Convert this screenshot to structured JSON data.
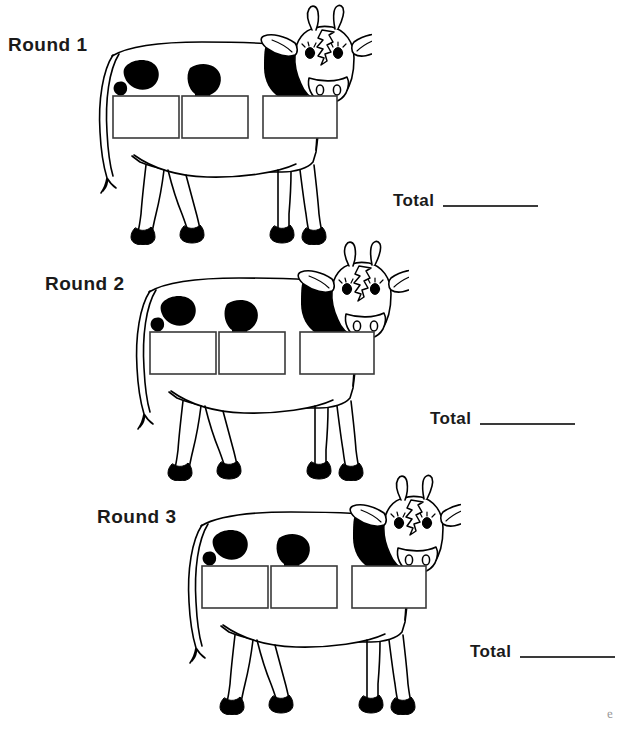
{
  "page": {
    "width": 627,
    "height": 734,
    "background_color": "#ffffff",
    "ink_color": "#000000",
    "line_color": "#3a3a3a"
  },
  "rounds": [
    {
      "label": "Round 1",
      "label_x": 8,
      "label_y": 34,
      "cow_x": 82,
      "cow_y": 0,
      "cow_scale": 1.0,
      "total": {
        "label": "Total",
        "value": "",
        "x": 393,
        "y": 192
      },
      "boxes": [
        {
          "name": "answer-box-1",
          "value": ""
        },
        {
          "name": "answer-box-2",
          "value": ""
        },
        {
          "name": "answer-box-3",
          "value": ""
        }
      ]
    },
    {
      "label": "Round 2",
      "label_x": 45,
      "label_y": 273,
      "cow_x": 119,
      "cow_y": 236,
      "cow_scale": 1.0,
      "total": {
        "label": "Total",
        "value": "",
        "x": 430,
        "y": 410
      },
      "boxes": [
        {
          "name": "answer-box-1",
          "value": ""
        },
        {
          "name": "answer-box-2",
          "value": ""
        },
        {
          "name": "answer-box-3",
          "value": ""
        }
      ]
    },
    {
      "label": "Round 3",
      "label_x": 97,
      "label_y": 506,
      "cow_x": 171,
      "cow_y": 470,
      "cow_scale": 1.0,
      "total": {
        "label": "Total",
        "value": "",
        "x": 470,
        "y": 643
      },
      "boxes": [
        {
          "name": "answer-box-1",
          "value": ""
        },
        {
          "name": "answer-box-2",
          "value": ""
        },
        {
          "name": "answer-box-3",
          "value": ""
        }
      ]
    }
  ],
  "signature": {
    "text": "e",
    "x": 607,
    "y": 706
  },
  "artwork": {
    "subject": "cow",
    "style": "black-and-white line drawing with solid black spots and hooves",
    "count": 3
  }
}
